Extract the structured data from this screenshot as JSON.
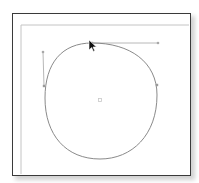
{
  "canvas": {
    "width": 199,
    "height": 183,
    "background": "#ffffff"
  },
  "artboard": {
    "border_color": "#3a3a3a",
    "fill": "#ffffff",
    "x": 12,
    "y": 13,
    "width": 177,
    "height": 161
  },
  "guides": {
    "color": "#bdbdbd",
    "horizontal_y": 25,
    "vertical_x": 21
  },
  "path": {
    "stroke": "#8a8a8a",
    "d": "M92,43 C130,43 157,62 157,95 C157,135 132,159 100,159 C66,159 45,135 45,98 C45,63 62,43 92,43 Z"
  },
  "handles": {
    "color": "#b8b8b8",
    "top": {
      "anchor": [
        92,
        43
      ],
      "end": [
        158,
        43
      ]
    },
    "left": {
      "anchor": [
        44,
        86
      ],
      "end": [
        43,
        52
      ]
    }
  },
  "anchors": {
    "color": "#9a9a9a",
    "points": [
      [
        92,
        43
      ],
      [
        157,
        85
      ],
      [
        44,
        86
      ]
    ]
  },
  "center_point": {
    "x": 100,
    "y": 100,
    "color": "#c8c8c8"
  },
  "cursor": {
    "type": "arrow",
    "x": 89,
    "y": 40,
    "color": "#111111"
  }
}
